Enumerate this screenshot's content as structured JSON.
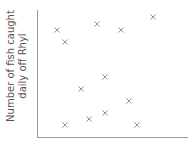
{
  "chart_data": {
    "type": "scatter",
    "title": "",
    "xlabel": "",
    "ylabel": "Number of fish caught daily off Rhyl",
    "ylabel_lines": [
      "Number of fish caught",
      "daily off Rhyl"
    ],
    "grid": false,
    "legend": null,
    "marker": "x",
    "marker_color": "#8a8a8a",
    "axis_color": "#9a9a9a",
    "points_px": [
      {
        "x": 57,
        "y": 30
      },
      {
        "x": 65,
        "y": 42
      },
      {
        "x": 97,
        "y": 24
      },
      {
        "x": 121,
        "y": 30
      },
      {
        "x": 153,
        "y": 17
      },
      {
        "x": 105,
        "y": 77
      },
      {
        "x": 81,
        "y": 89
      },
      {
        "x": 129,
        "y": 101
      },
      {
        "x": 89,
        "y": 119
      },
      {
        "x": 105,
        "y": 113
      },
      {
        "x": 65,
        "y": 125
      },
      {
        "x": 137,
        "y": 125
      }
    ],
    "axes_px": {
      "origin": [
        37,
        137
      ],
      "x_end": 188,
      "y_top": 10
    }
  }
}
